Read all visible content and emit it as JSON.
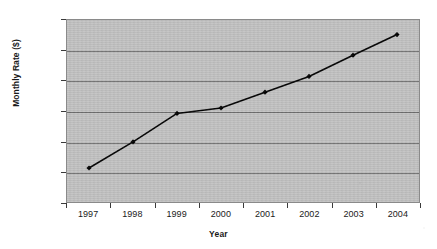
{
  "chart_data": {
    "type": "line",
    "title": "",
    "xlabel": "Year",
    "ylabel": "Monthly Rate ($)",
    "categories": [
      "1997",
      "1998",
      "1999",
      "2000",
      "2001",
      "2002",
      "2003",
      "2004"
    ],
    "values": [
      11.56,
      11.99,
      12.46,
      12.55,
      12.81,
      13.07,
      13.42,
      13.76
    ],
    "series": [
      {
        "name": "Monthly Rate",
        "values": [
          11.56,
          11.99,
          12.46,
          12.55,
          12.81,
          13.07,
          13.42,
          13.76
        ]
      }
    ],
    "ylim": [
      11.0,
      14.0
    ],
    "ytick_values": [
      14.0,
      13.5,
      13.0,
      12.5,
      12.0,
      11.5,
      11.0
    ],
    "ytick_labels": [
      "14.00",
      "13.50",
      "13.00",
      "12.50",
      "12.00",
      "11.50",
      "11.00"
    ],
    "xtick_labels": [
      "1997",
      "1998",
      "1999",
      "2000",
      "2001",
      "2002",
      "2003",
      "2004"
    ],
    "grid": "horizontal",
    "legend": "none",
    "marker": "diamond",
    "colors": {
      "line": "#000000",
      "marker": "#000000",
      "plot_background": "#c2c2c2",
      "gridline": "#6f6f6f",
      "plot_border": "#8a8a8a",
      "page_background": "#ffffff",
      "text": "#1a1a1a"
    }
  }
}
